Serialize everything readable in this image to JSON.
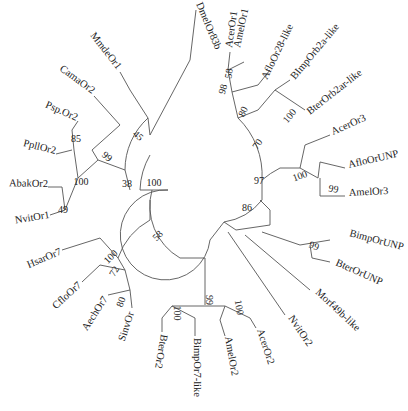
{
  "figure": {
    "type": "circular phylogenetic tree",
    "taxa": [
      {
        "id": "t_dmel",
        "label": "DmelOr83b",
        "x": 196,
        "y": 4,
        "rot": 67,
        "anchor": "start"
      },
      {
        "id": "t_acer1",
        "label": "AcerOr1",
        "x": 232,
        "y": 48,
        "rot": -82,
        "anchor": "start"
      },
      {
        "id": "t_amel1",
        "label": "AmelOr1",
        "x": 240,
        "y": 48,
        "rot": -78,
        "anchor": "start"
      },
      {
        "id": "t_aflo28",
        "label": "AfloOr28-like",
        "x": 267,
        "y": 80,
        "rot": -64,
        "anchor": "start"
      },
      {
        "id": "t_bimp2a",
        "label": "BImpOrb2a-like",
        "x": 295,
        "y": 80,
        "rot": -50,
        "anchor": "start"
      },
      {
        "id": "t_bter2a",
        "label": "BterOrb2ar-like",
        "x": 310,
        "y": 115,
        "rot": -38,
        "anchor": "start"
      },
      {
        "id": "t_acer3",
        "label": "AcerOr3",
        "x": 333,
        "y": 135,
        "rot": -24,
        "anchor": "start"
      },
      {
        "id": "t_aflounp",
        "label": "AfloOrUNP",
        "x": 349,
        "y": 168,
        "rot": -13,
        "anchor": "start"
      },
      {
        "id": "t_amel3",
        "label": "AmelOr3",
        "x": 349,
        "y": 196,
        "rot": -3,
        "anchor": "start"
      },
      {
        "id": "t_bimpunp",
        "label": "BimpOrUNP",
        "x": 349,
        "y": 236,
        "rot": 15,
        "anchor": "start"
      },
      {
        "id": "t_bterunp",
        "label": "BterOrUNP",
        "x": 335,
        "y": 265,
        "rot": 24,
        "anchor": "start"
      },
      {
        "id": "t_morf49",
        "label": "Morf49b-like",
        "x": 315,
        "y": 293,
        "rot": 43,
        "anchor": "start"
      },
      {
        "id": "t_nvit2",
        "label": "NvitOr2",
        "x": 288,
        "y": 318,
        "rot": 56,
        "anchor": "start"
      },
      {
        "id": "t_acer2",
        "label": "AcerOr2",
        "x": 257,
        "y": 330,
        "rot": 72,
        "anchor": "start"
      },
      {
        "id": "t_amel2",
        "label": "AmelOr2",
        "x": 225,
        "y": 337,
        "rot": 80,
        "anchor": "start"
      },
      {
        "id": "t_bimp7",
        "label": "BimpOr7-like",
        "x": 194,
        "y": 338,
        "rot": 90,
        "anchor": "start"
      },
      {
        "id": "t_bter2",
        "label": "BterOr2",
        "x": 161,
        "y": 334,
        "rot": 100,
        "anchor": "start"
      },
      {
        "id": "t_sinv",
        "label": "SinvOr",
        "x": 134,
        "y": 313,
        "rot": -72,
        "anchor": "end"
      },
      {
        "id": "t_aech7",
        "label": "AechOr7",
        "x": 108,
        "y": 299,
        "rot": -57,
        "anchor": "end"
      },
      {
        "id": "t_cflo7",
        "label": "CfloOr7",
        "x": 82,
        "y": 286,
        "rot": -42,
        "anchor": "end"
      },
      {
        "id": "t_hsar7",
        "label": "HsarOr7",
        "x": 62,
        "y": 254,
        "rot": -23,
        "anchor": "end"
      },
      {
        "id": "t_nvit1",
        "label": "NvitOr1",
        "x": 50,
        "y": 218,
        "rot": -9,
        "anchor": "end"
      },
      {
        "id": "t_abak2",
        "label": "AbakOr2",
        "x": 48,
        "y": 187,
        "rot": 1,
        "anchor": "end"
      },
      {
        "id": "t_ppll2",
        "label": "PpllOr2",
        "x": 55,
        "y": 154,
        "rot": 14,
        "anchor": "end"
      },
      {
        "id": "t_psp2",
        "label": "Psp.Or2",
        "x": 76,
        "y": 121,
        "rot": 24,
        "anchor": "end"
      },
      {
        "id": "t_cama2",
        "label": "CamaOr2",
        "x": 92,
        "y": 94,
        "rot": 36,
        "anchor": "end"
      },
      {
        "id": "t_mmde1",
        "label": "MmdeOr1",
        "x": 117,
        "y": 70,
        "rot": 52,
        "anchor": "end"
      }
    ],
    "bootstrap": [
      {
        "value": "58",
        "x": 232,
        "y": 74,
        "rot": -80
      },
      {
        "value": "98",
        "x": 226,
        "y": 90,
        "rot": -75
      },
      {
        "value": "80",
        "x": 246,
        "y": 113,
        "rot": -65
      },
      {
        "value": "100",
        "x": 292,
        "y": 118,
        "rot": -50
      },
      {
        "value": "70",
        "x": 260,
        "y": 146,
        "rot": -55
      },
      {
        "value": "100",
        "x": 301,
        "y": 179,
        "rot": -20
      },
      {
        "value": "99",
        "x": 333,
        "y": 192,
        "rot": 10
      },
      {
        "value": "97",
        "x": 259,
        "y": 184,
        "rot": 0
      },
      {
        "value": "86",
        "x": 247,
        "y": 211,
        "rot": 0
      },
      {
        "value": "99",
        "x": 313,
        "y": 249,
        "rot": 20
      },
      {
        "value": "100",
        "x": 154,
        "y": 186,
        "rot": 0
      },
      {
        "value": "58",
        "x": 160,
        "y": 238,
        "rot": -45
      },
      {
        "value": "38",
        "x": 127,
        "y": 187,
        "rot": 0
      },
      {
        "value": "45",
        "x": 136,
        "y": 138,
        "rot": 42
      },
      {
        "value": "99",
        "x": 105,
        "y": 159,
        "rot": 40
      },
      {
        "value": "100",
        "x": 81,
        "y": 185,
        "rot": 0
      },
      {
        "value": "85",
        "x": 76,
        "y": 142,
        "rot": 0
      },
      {
        "value": "49",
        "x": 63,
        "y": 213,
        "rot": 0
      },
      {
        "value": "100",
        "x": 113,
        "y": 259,
        "rot": -45
      },
      {
        "value": "72",
        "x": 117,
        "y": 273,
        "rot": -60
      },
      {
        "value": "80",
        "x": 124,
        "y": 303,
        "rot": -70
      },
      {
        "value": "99",
        "x": 206,
        "y": 300,
        "rot": 90
      },
      {
        "value": "100",
        "x": 236,
        "y": 308,
        "rot": 80
      },
      {
        "value": "100",
        "x": 174,
        "y": 313,
        "rot": 90
      }
    ]
  }
}
